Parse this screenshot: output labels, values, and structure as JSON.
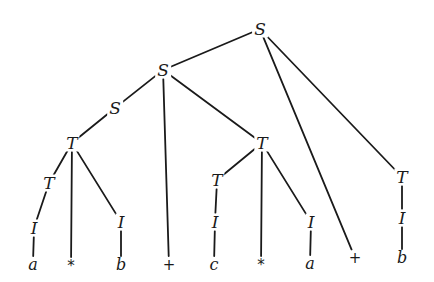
{
  "diagram": {
    "type": "parse-tree",
    "line_color": "#1a1a1a",
    "nodes": [
      {
        "id": "n0",
        "label": "S",
        "x": 260,
        "y": 29,
        "kind": "nonterminal"
      },
      {
        "id": "n1",
        "label": "S",
        "x": 163,
        "y": 70,
        "kind": "nonterminal"
      },
      {
        "id": "n2",
        "label": "S",
        "x": 115,
        "y": 108,
        "kind": "nonterminal"
      },
      {
        "id": "n3",
        "label": "T",
        "x": 72,
        "y": 143,
        "kind": "nonterminal"
      },
      {
        "id": "n4",
        "label": "T",
        "x": 49,
        "y": 183,
        "kind": "nonterminal"
      },
      {
        "id": "n5",
        "label": "I",
        "x": 34,
        "y": 228,
        "kind": "nonterminal"
      },
      {
        "id": "n6",
        "label": "a",
        "x": 33,
        "y": 265,
        "kind": "terminal"
      },
      {
        "id": "n7",
        "label": "*",
        "x": 71,
        "y": 266,
        "kind": "op"
      },
      {
        "id": "n8",
        "label": "I",
        "x": 121,
        "y": 222,
        "kind": "nonterminal"
      },
      {
        "id": "n9",
        "label": "b",
        "x": 121,
        "y": 265,
        "kind": "terminal"
      },
      {
        "id": "n10",
        "label": "+",
        "x": 169,
        "y": 265,
        "kind": "op"
      },
      {
        "id": "n11",
        "label": "T",
        "x": 262,
        "y": 143,
        "kind": "nonterminal"
      },
      {
        "id": "n12",
        "label": "T",
        "x": 217,
        "y": 180,
        "kind": "nonterminal"
      },
      {
        "id": "n13",
        "label": "I",
        "x": 215,
        "y": 222,
        "kind": "nonterminal"
      },
      {
        "id": "n14",
        "label": "c",
        "x": 214,
        "y": 265,
        "kind": "terminal"
      },
      {
        "id": "n15",
        "label": "*",
        "x": 261,
        "y": 265,
        "kind": "op"
      },
      {
        "id": "n16",
        "label": "I",
        "x": 311,
        "y": 222,
        "kind": "nonterminal"
      },
      {
        "id": "n17",
        "label": "a",
        "x": 310,
        "y": 264,
        "kind": "terminal"
      },
      {
        "id": "n18",
        "label": "+",
        "x": 355,
        "y": 258,
        "kind": "op"
      },
      {
        "id": "n19",
        "label": "T",
        "x": 402,
        "y": 177,
        "kind": "nonterminal"
      },
      {
        "id": "n20",
        "label": "I",
        "x": 402,
        "y": 218,
        "kind": "nonterminal"
      },
      {
        "id": "n21",
        "label": "b",
        "x": 402,
        "y": 258,
        "kind": "terminal"
      }
    ],
    "edges": [
      [
        "n0",
        "n1"
      ],
      [
        "n0",
        "n18"
      ],
      [
        "n0",
        "n19"
      ],
      [
        "n1",
        "n2"
      ],
      [
        "n1",
        "n10"
      ],
      [
        "n1",
        "n11"
      ],
      [
        "n2",
        "n3"
      ],
      [
        "n3",
        "n4"
      ],
      [
        "n3",
        "n7"
      ],
      [
        "n3",
        "n8"
      ],
      [
        "n4",
        "n5"
      ],
      [
        "n5",
        "n6"
      ],
      [
        "n8",
        "n9"
      ],
      [
        "n11",
        "n12"
      ],
      [
        "n11",
        "n15"
      ],
      [
        "n11",
        "n16"
      ],
      [
        "n12",
        "n13"
      ],
      [
        "n13",
        "n14"
      ],
      [
        "n16",
        "n17"
      ],
      [
        "n19",
        "n20"
      ],
      [
        "n20",
        "n21"
      ]
    ],
    "yield": "a * b + c * a + b"
  }
}
